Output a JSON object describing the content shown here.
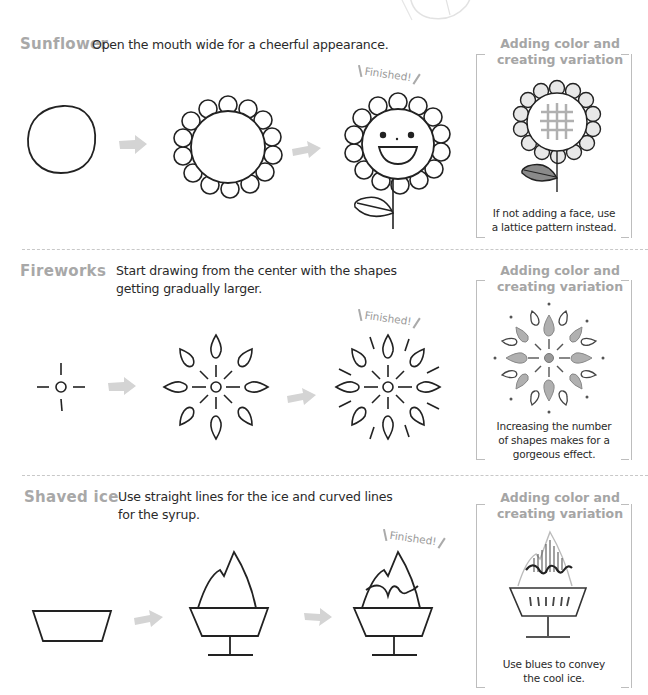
{
  "sections": [
    {
      "title": "Sunflower",
      "description": "Open the mouth wide for a cheerful appearance.",
      "finished_label": "Finished!",
      "steps": [
        "circle",
        "petals-added",
        "face-stem-leaf"
      ],
      "variation": {
        "title_line1": "Adding color and",
        "title_line2": "creating variation",
        "caption_line1": "If not adding a face, use",
        "caption_line2": "a lattice pattern instead."
      }
    },
    {
      "title": "Fireworks",
      "description_line1": "Start drawing from the center with the shapes",
      "description_line2": "getting gradually larger.",
      "finished_label": "Finished!",
      "steps": [
        "center-cross",
        "drops-ring",
        "full-burst"
      ],
      "variation": {
        "title_line1": "Adding color and",
        "title_line2": "creating variation",
        "caption_line1": "Increasing the number",
        "caption_line2": "of shapes makes for a",
        "caption_line3": "gorgeous effect."
      }
    },
    {
      "title": "Shaved ice",
      "description_line1": "Use straight lines for the ice and curved lines",
      "description_line2": "for the syrup.",
      "finished_label": "Finished!",
      "steps": [
        "cup",
        "ice-mound-stand",
        "syrup-added"
      ],
      "variation": {
        "title_line1": "Adding color and",
        "title_line2": "creating variation",
        "caption_line1": "Use blues to convey",
        "caption_line2": "the cool ice."
      }
    }
  ],
  "colors": {
    "title_gray": "#a8a8a8",
    "arrow_gray": "#d4d4d4",
    "line_black": "#222222",
    "frame_gray": "#bdbdbd"
  },
  "icons": [
    "arrow-right-icon",
    "sunflower-drawing",
    "fireworks-drawing",
    "shaved-ice-drawing"
  ]
}
